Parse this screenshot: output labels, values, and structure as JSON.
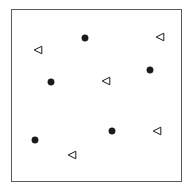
{
  "figure": {
    "width": 193,
    "height": 191,
    "background_color": "#ffffff"
  },
  "frame": {
    "x": 11,
    "y": 9,
    "width": 171,
    "height": 173,
    "border_color": "#5a5a5a",
    "border_width": 1,
    "fill_color": "#ffffff"
  },
  "chart_data": {
    "type": "scatter",
    "title": "",
    "subtitle": "",
    "xlabel": "",
    "ylabel": "",
    "xlim": [
      0,
      193
    ],
    "ylim": [
      0,
      191
    ],
    "grid": false,
    "axis_ticks": false,
    "axis_tick_labels": false,
    "legend": false,
    "legend_position": "none",
    "annotations": [],
    "series": [
      {
        "name": "filled-circle-series",
        "marker": "circle",
        "marker_filled": true,
        "marker_color": "#1a1a1a",
        "marker_edge_color": "#1a1a1a",
        "marker_size": 7,
        "count": 5,
        "points": [
          {
            "x": 85,
            "y": 38
          },
          {
            "x": 150,
            "y": 70
          },
          {
            "x": 51,
            "y": 82
          },
          {
            "x": 112,
            "y": 131
          },
          {
            "x": 35,
            "y": 140
          }
        ]
      },
      {
        "name": "open-left-triangle-series",
        "marker": "triangle-left",
        "marker_filled": false,
        "marker_color": "#ffffff",
        "marker_edge_color": "#1a1a1a",
        "marker_size": 9,
        "count": 5,
        "points": [
          {
            "x": 160,
            "y": 37
          },
          {
            "x": 38,
            "y": 50
          },
          {
            "x": 106,
            "y": 81
          },
          {
            "x": 157,
            "y": 131
          },
          {
            "x": 72,
            "y": 155
          }
        ]
      }
    ]
  }
}
